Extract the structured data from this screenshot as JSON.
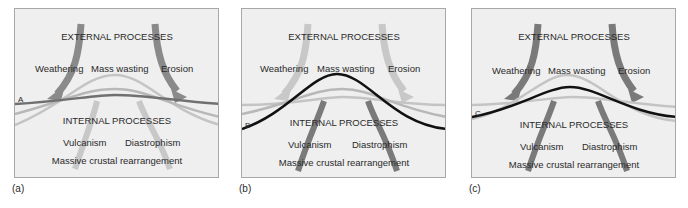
{
  "panels": [
    {
      "id": "a",
      "label": "(a)",
      "line_label": "A",
      "external_heading": "EXTERNAL PROCESSES",
      "external_items": [
        "Weathering",
        "Mass wasting",
        "Erosion"
      ],
      "internal_heading": "INTERNAL PROCESSES",
      "internal_items": [
        "Vulcanism",
        "Diastrophism"
      ],
      "internal_footer": "Massive crustal rearrangement",
      "emphasis": "balanced",
      "external_arrow_color": "#8a8a8a",
      "internal_arrow_color": "#c8c8c8",
      "profile_color": "#707070"
    },
    {
      "id": "b",
      "label": "(b)",
      "line_label": "B",
      "external_heading": "EXTERNAL PROCESSES",
      "external_items": [
        "Weathering",
        "Mass wasting",
        "Erosion"
      ],
      "internal_heading": "INTERNAL PROCESSES",
      "internal_items": [
        "Vulcanism",
        "Diastrophism"
      ],
      "internal_footer": "Massive crustal rearrangement",
      "emphasis": "internal dominant",
      "external_arrow_color": "#c8c8c8",
      "internal_arrow_color": "#7a7a7a",
      "profile_color": "#111111"
    },
    {
      "id": "c",
      "label": "(c)",
      "line_label": "C",
      "external_heading": "EXTERNAL PROCESSES",
      "external_items": [
        "Weathering",
        "Mass wasting",
        "Erosion"
      ],
      "internal_heading": "INTERNAL PROCESSES",
      "internal_items": [
        "Vulcanism",
        "Diastrophism"
      ],
      "internal_footer": "Massive crustal rearrangement",
      "emphasis": "external dominant",
      "external_arrow_color": "#7a7a7a",
      "internal_arrow_color": "#7a7a7a",
      "profile_color": "#111111"
    }
  ]
}
